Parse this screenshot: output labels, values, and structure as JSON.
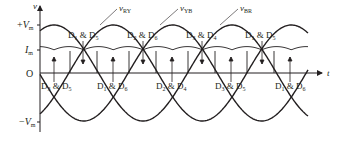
{
  "diagram": {
    "axes": {
      "y_label": "v",
      "x_label": "t",
      "origin_label": "O",
      "ticks": {
        "plus_vm": {
          "sign": "+",
          "sym": "V",
          "sub": "m"
        },
        "im": {
          "sym": "I",
          "sub": "m"
        },
        "minus_vm": {
          "sign": "−",
          "sym": "V",
          "sub": "m"
        }
      }
    },
    "waveforms": [
      {
        "id": "vRY",
        "sym": "v",
        "sub": "RY"
      },
      {
        "id": "vYB",
        "sym": "v",
        "sub": "YB"
      },
      {
        "id": "vBR",
        "sym": "v",
        "sub": "BR"
      }
    ],
    "upper_diode_labels": [
      {
        "a": "D",
        "as": "1",
        "amp": "&",
        "b": "D",
        "bs": "5"
      },
      {
        "a": "D",
        "as": "2",
        "amp": "&",
        "b": "D",
        "bs": "6"
      },
      {
        "a": "D",
        "as": "3",
        "amp": "&",
        "b": "D",
        "bs": "4"
      },
      {
        "a": "D",
        "as": "1",
        "amp": "&",
        "b": "D",
        "bs": "5"
      }
    ],
    "lower_diode_labels": [
      {
        "a": "D",
        "as": "3",
        "amp": "&",
        "b": "D",
        "bs": "5"
      },
      {
        "a": "D",
        "as": "1",
        "amp": "&",
        "b": "D",
        "bs": "6"
      },
      {
        "a": "D",
        "as": "2",
        "amp": "&",
        "b": "D",
        "bs": "4"
      },
      {
        "a": "D",
        "as": "3",
        "amp": "&",
        "b": "D",
        "bs": "5"
      },
      {
        "a": "D",
        "as": "1",
        "amp": "&",
        "b": "D",
        "bs": "6"
      }
    ],
    "colors": {
      "stroke": "#231f20",
      "background": "#ffffff"
    }
  }
}
